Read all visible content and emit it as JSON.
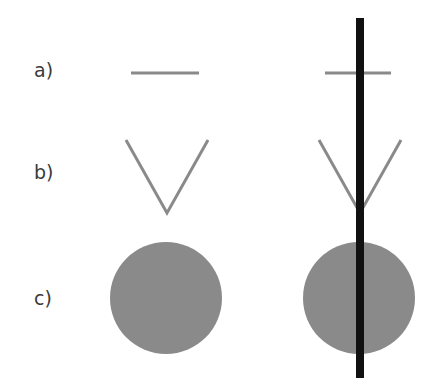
{
  "rows": [
    {
      "label": "a)",
      "shape": "horizontal-line"
    },
    {
      "label": "b)",
      "shape": "v-shape"
    },
    {
      "label": "c)",
      "shape": "filled-circle"
    }
  ],
  "colors": {
    "shape": "#8a8a8a",
    "bar": "#111111",
    "label": "#3a3a3a"
  }
}
